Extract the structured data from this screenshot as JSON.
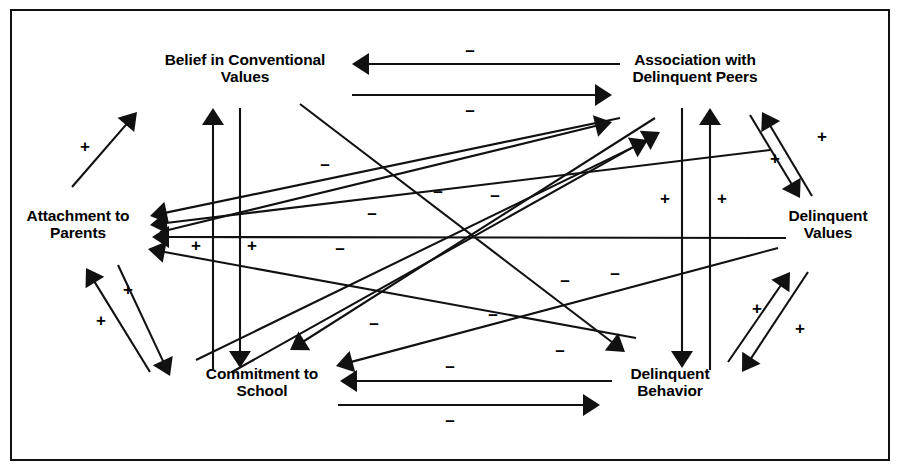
{
  "figure": {
    "kind": "path-diagram",
    "background": "#ffffff",
    "ink": "#111111",
    "border": {
      "visible": true,
      "color": "#111111",
      "width": 2
    },
    "width": 902,
    "height": 474
  },
  "nodes": [
    {
      "id": "belief",
      "label": "Belief in Conventional\nValues",
      "x": 245,
      "y": 68,
      "w": 200
    },
    {
      "id": "peers",
      "label": "Association with\nDelinquent Peers",
      "x": 695,
      "y": 68,
      "w": 180
    },
    {
      "id": "attachment",
      "label": "Attachment to\nParents",
      "x": 78,
      "y": 224,
      "w": 135
    },
    {
      "id": "values",
      "label": "Delinquent\nValues",
      "x": 828,
      "y": 224,
      "w": 115
    },
    {
      "id": "commitment",
      "label": "Commitment to\nSchool",
      "x": 262,
      "y": 382,
      "w": 150
    },
    {
      "id": "behavior",
      "label": "Delinquent\nBehavior",
      "x": 670,
      "y": 382,
      "w": 120
    }
  ],
  "signs": {
    "positive": "+",
    "negative": "–"
  },
  "edges": [
    {
      "id": "e1",
      "from": "peers",
      "to": "belief",
      "sign": "–",
      "shape": "horizontal-top",
      "label_x": 470,
      "label_y": 52,
      "x1": 620,
      "y1": 64,
      "x2": 352,
      "y2": 64
    },
    {
      "id": "e2",
      "from": "belief",
      "to": "peers",
      "sign": "–",
      "shape": "horizontal-top",
      "label_x": 470,
      "label_y": 112,
      "x1": 352,
      "y1": 95,
      "x2": 612,
      "y2": 95
    },
    {
      "id": "e3",
      "from": "belief",
      "to": "commitment",
      "sign": "+",
      "shape": "vertical-left",
      "label_x": 196,
      "label_y": 247,
      "x1": 213,
      "y1": 370,
      "x2": 213,
      "y2": 108
    },
    {
      "id": "e4",
      "from": "belief",
      "to": "commitment",
      "sign": "+",
      "shape": "vertical-right",
      "label_x": 252,
      "label_y": 247,
      "x1": 240,
      "y1": 108,
      "x2": 240,
      "y2": 368
    },
    {
      "id": "e5",
      "from": "peers",
      "to": "behavior",
      "sign": "+",
      "shape": "vertical-left",
      "label_x": 665,
      "label_y": 200,
      "x1": 682,
      "y1": 108,
      "x2": 682,
      "y2": 368
    },
    {
      "id": "e6",
      "from": "behavior",
      "to": "peers",
      "sign": "+",
      "shape": "vertical-right",
      "label_x": 722,
      "label_y": 200,
      "x1": 710,
      "y1": 370,
      "x2": 710,
      "y2": 108
    },
    {
      "id": "e7",
      "from": "attachment",
      "to": "belief",
      "sign": "+",
      "shape": "diagonal",
      "label_x": 85,
      "label_y": 148,
      "x1": 72,
      "y1": 187,
      "x2": 137,
      "y2": 112
    },
    {
      "id": "e8",
      "from": "peers",
      "to": "attachment",
      "sign": "–",
      "shape": "diagonal",
      "label_x": 325,
      "label_y": 166,
      "x1": 620,
      "y1": 118,
      "x2": 150,
      "y2": 216
    },
    {
      "id": "e9",
      "from": "values",
      "to": "attachment",
      "sign": "–",
      "shape": "diagonal",
      "label_x": 438,
      "label_y": 193,
      "x1": 770,
      "y1": 150,
      "x2": 150,
      "y2": 225
    },
    {
      "id": "e10",
      "from": "values",
      "to": "attachment",
      "sign": "–",
      "shape": "horizontal-middle",
      "label_x": 372,
      "label_y": 215,
      "x1": 786,
      "y1": 238,
      "x2": 152,
      "y2": 237
    },
    {
      "id": "e11",
      "from": "behavior",
      "to": "attachment",
      "sign": "–",
      "shape": "diagonal",
      "label_x": 615,
      "label_y": 275,
      "x1": 636,
      "y1": 338,
      "x2": 148,
      "y2": 249
    },
    {
      "id": "e12",
      "from": "attachment",
      "to": "commitment",
      "sign": "+",
      "shape": "diagonal-pair",
      "label_x": 128,
      "label_y": 291,
      "x1": 118,
      "y1": 265,
      "x2": 170,
      "y2": 376
    },
    {
      "id": "e13",
      "from": "commitment",
      "to": "attachment",
      "sign": "+",
      "shape": "diagonal-pair",
      "label_x": 101,
      "label_y": 322,
      "x1": 150,
      "y1": 372,
      "x2": 86,
      "y2": 268
    },
    {
      "id": "e14",
      "from": "attachment",
      "to": "peers",
      "sign": "–",
      "shape": "diagonal",
      "label_x": 495,
      "label_y": 197,
      "x1": 160,
      "y1": 232,
      "x2": 612,
      "y2": 122
    },
    {
      "id": "e15",
      "from": "commitment",
      "to": "peers",
      "sign": "–",
      "shape": "diagonal",
      "label_x": 565,
      "label_y": 282,
      "x1": 196,
      "y1": 360,
      "x2": 648,
      "y2": 140
    },
    {
      "id": "e16",
      "from": "commitment",
      "to": "peers",
      "sign": "–",
      "shape": "diagonal",
      "label_x": 340,
      "label_y": 250,
      "x1": 232,
      "y1": 372,
      "x2": 660,
      "y2": 132
    },
    {
      "id": "e17",
      "from": "belief",
      "to": "behavior",
      "sign": "–",
      "shape": "diagonal",
      "label_x": 493,
      "label_y": 316,
      "x1": 300,
      "y1": 104,
      "x2": 625,
      "y2": 352
    },
    {
      "id": "e18",
      "from": "peers",
      "to": "commitment",
      "sign": "–",
      "shape": "diagonal",
      "label_x": 374,
      "label_y": 325,
      "x1": 655,
      "y1": 118,
      "x2": 290,
      "y2": 350
    },
    {
      "id": "e19",
      "from": "values",
      "to": "commitment",
      "sign": "–",
      "shape": "diagonal",
      "label_x": 560,
      "label_y": 352,
      "x1": 778,
      "y1": 248,
      "x2": 336,
      "y2": 366
    },
    {
      "id": "e20",
      "from": "behavior",
      "to": "commitment",
      "sign": "–",
      "shape": "horizontal-bottom",
      "label_x": 450,
      "label_y": 368,
      "x1": 612,
      "y1": 381,
      "x2": 340,
      "y2": 381
    },
    {
      "id": "e21",
      "from": "commitment",
      "to": "behavior",
      "sign": "–",
      "shape": "horizontal-bottom",
      "label_x": 450,
      "label_y": 422,
      "x1": 338,
      "y1": 405,
      "x2": 600,
      "y2": 405
    },
    {
      "id": "e22",
      "from": "peers",
      "to": "values",
      "sign": "+",
      "shape": "diagonal-pair",
      "label_x": 775,
      "label_y": 160,
      "x1": 750,
      "y1": 115,
      "x2": 800,
      "y2": 198
    },
    {
      "id": "e23",
      "from": "values",
      "to": "peers",
      "sign": "+",
      "shape": "diagonal-pair",
      "label_x": 822,
      "label_y": 138,
      "x1": 812,
      "y1": 196,
      "x2": 762,
      "y2": 112
    },
    {
      "id": "e24",
      "from": "behavior",
      "to": "values",
      "sign": "+",
      "shape": "diagonal-pair",
      "label_x": 757,
      "label_y": 310,
      "x1": 728,
      "y1": 362,
      "x2": 790,
      "y2": 272
    },
    {
      "id": "e25",
      "from": "values",
      "to": "behavior",
      "sign": "+",
      "shape": "diagonal-pair",
      "label_x": 800,
      "label_y": 330,
      "x1": 808,
      "y1": 272,
      "x2": 742,
      "y2": 372
    }
  ]
}
